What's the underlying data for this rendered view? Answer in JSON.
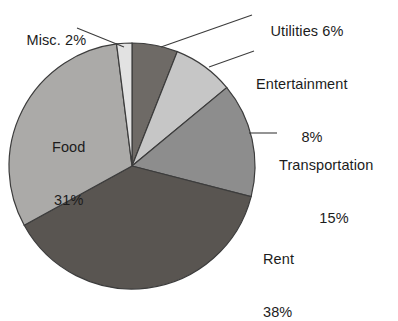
{
  "chart_data": {
    "type": "pie",
    "title": "",
    "categories": [
      "Utilities",
      "Entertainment",
      "Transportation",
      "Rent",
      "Food",
      "Misc."
    ],
    "values": [
      6,
      8,
      15,
      38,
      31,
      2
    ],
    "unit": "%",
    "start_angle_deg": 0,
    "direction": "clockwise",
    "legend": "none",
    "labels_position": "outside-and-inside",
    "slices": [
      {
        "name": "Utilities",
        "value": 6,
        "label": "Utilities 6%",
        "color": "#6e6a66",
        "label_placement": "outside",
        "leader": true
      },
      {
        "name": "Entertainment",
        "value": 8,
        "label": "Entertainment",
        "value_label": "8%",
        "color": "#c6c6c6",
        "label_placement": "outside",
        "leader": true
      },
      {
        "name": "Transportation",
        "value": 15,
        "label": "Transportation",
        "value_label": "15%",
        "color": "#8d8d8d",
        "label_placement": "outside",
        "leader": true
      },
      {
        "name": "Rent",
        "value": 38,
        "label": "Rent",
        "value_label": "38%",
        "color": "#595551",
        "label_placement": "outside",
        "leader": false
      },
      {
        "name": "Food",
        "value": 31,
        "label": "Food",
        "value_label": "31%",
        "color": "#abaaa8",
        "label_placement": "inside",
        "leader": false
      },
      {
        "name": "Misc.",
        "value": 2,
        "label": "Misc. 2%",
        "color": "#e2e2e2",
        "label_placement": "outside",
        "leader": true
      }
    ]
  },
  "labels": {
    "misc": "Misc. 2%",
    "utilities": "Utilities 6%",
    "entertainment_name": "Entertainment",
    "entertainment_value": "8%",
    "transportation_name": "Transportation",
    "transportation_value": "15%",
    "rent_name": "Rent",
    "rent_value": "38%",
    "food_name": "Food",
    "food_value": "31%"
  },
  "colors": {
    "utilities": "#6e6a66",
    "entertainment": "#c6c6c6",
    "transportation": "#8d8d8d",
    "rent": "#595551",
    "food": "#abaaa8",
    "misc": "#e2e2e2",
    "outline": "#3c3c3c",
    "leader": "#3c3c3c",
    "text": "#1c1c1c",
    "background": "#ffffff"
  },
  "geometry": {
    "center_x": 132,
    "center_y": 166,
    "radius": 123
  }
}
